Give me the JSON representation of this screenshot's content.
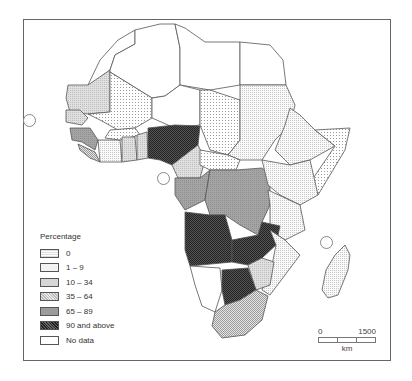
{
  "legend": {
    "title": "Percentage",
    "items": [
      {
        "label": "0",
        "pattern": "dots-light",
        "color": "#e8e8e8"
      },
      {
        "label": "1 – 9",
        "pattern": "fine-light",
        "color": "#efefef"
      },
      {
        "label": "10 – 34",
        "pattern": "light-grey",
        "color": "#d6d6d6"
      },
      {
        "label": "35 – 64",
        "pattern": "mid-dots",
        "color": "#cfcfcf"
      },
      {
        "label": "65 – 89",
        "pattern": "mid-grey",
        "color": "#9c9c9c"
      },
      {
        "label": "90 and above",
        "pattern": "dark-check",
        "color": "#3a3a3a"
      },
      {
        "label": "No data",
        "pattern": "none",
        "color": "#ffffff"
      }
    ]
  },
  "scale": {
    "start": "0",
    "end": "1500",
    "unit": "km"
  }
}
